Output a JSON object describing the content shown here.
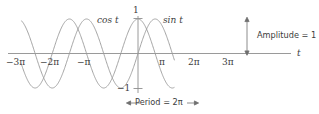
{
  "figure": {
    "background_color": "#ffffff",
    "curve_color": "#9a9a9a",
    "axis_color": "#8e8e8e",
    "text_color": "#3f3f3f"
  },
  "labels": {
    "cos_label": "cos t",
    "sin_label": "sin t",
    "axis_label_t": "t",
    "y_top": "1",
    "y_bottom": "−1",
    "amplitude": "Amplitude = 1",
    "period": "Period = 2π"
  },
  "chart_data": {
    "type": "line",
    "title": "",
    "subtitle": "",
    "xlabel": "t",
    "ylabel": "",
    "xlim": [
      -10.996,
      3.665
    ],
    "ylim": [
      -1,
      1
    ],
    "grid": false,
    "legend_position": "inline-annotation",
    "x_tick_labels": [
      "−3π",
      "−2π",
      "−π",
      "π",
      "2π",
      "3π"
    ],
    "x_tick_values": [
      -9.4248,
      -6.2832,
      -3.1416,
      3.1416,
      6.2832,
      9.4248
    ],
    "y_tick_labels": [
      "1",
      "−1"
    ],
    "y_tick_values": [
      1,
      -1
    ],
    "x_domain_drawn": [
      -10.7,
      3.35
    ],
    "series": [
      {
        "name": "cos t",
        "function": "cos(t)",
        "amplitude": 1,
        "period": 6.2832,
        "phase": 0,
        "label_position_t": -1.45,
        "label_position_y": 1.28
      },
      {
        "name": "sin t",
        "function": "sin(t)",
        "amplitude": 1,
        "period": 6.2832,
        "phase": 0,
        "label_position_t": 1.32,
        "label_position_y": 1.28
      }
    ],
    "annotations": [
      {
        "text": "Amplitude = 1",
        "type": "vertical-double-arrow",
        "from_y": 0,
        "to_y": 1
      },
      {
        "text": "Period = 2π",
        "type": "horizontal-double-arrow",
        "from_t": -0.32,
        "to_t": 5.96
      }
    ]
  }
}
